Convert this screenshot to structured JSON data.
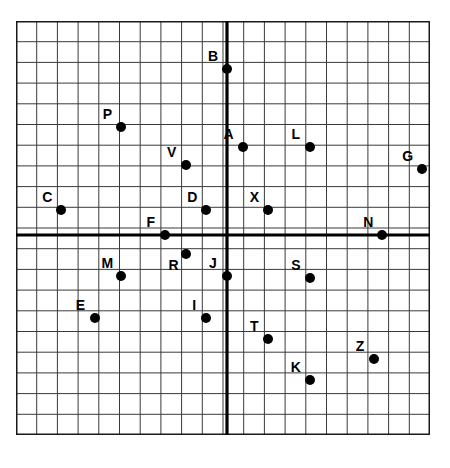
{
  "figure": {
    "type": "coordinate-plane",
    "grid": {
      "visible": true,
      "cell_size_px": 20.7,
      "columns": 20,
      "rows": 20,
      "line_color": "#3a3a3a",
      "border_color": "#1a1a1a",
      "background": "#ffffff"
    },
    "axes": {
      "color": "#000000",
      "x_axis_label": "",
      "y_axis_label": "",
      "origin_label": "",
      "arrows": [
        "left",
        "right",
        "up",
        "down"
      ],
      "xlim": [
        -10.2,
        9.8
      ],
      "ylim": [
        -10.3,
        9.7
      ],
      "tick_labels_visible": false
    }
  },
  "chart_data": {
    "type": "scatter",
    "title": "",
    "xlabel": "",
    "ylabel": "",
    "xlim": [
      -10.2,
      9.8
    ],
    "ylim": [
      -10.3,
      9.7
    ],
    "grid": true,
    "legend": "none",
    "point_color": "#000000",
    "labels": [
      "B",
      "P",
      "A",
      "L",
      "G",
      "V",
      "C",
      "D",
      "X",
      "F",
      "N",
      "R",
      "M",
      "J",
      "S",
      "E",
      "I",
      "T",
      "Z",
      "K"
    ],
    "points": [
      {
        "label": "B",
        "x": 0,
        "y": 8,
        "label_dx": -14,
        "label_dy": -13
      },
      {
        "label": "P",
        "x": -5.1,
        "y": 5.2,
        "label_dx": -14,
        "label_dy": -13
      },
      {
        "label": "A",
        "x": 0.75,
        "y": 4.25,
        "label_dx": -14,
        "label_dy": -13
      },
      {
        "label": "L",
        "x": 4,
        "y": 4.25,
        "label_dx": -14,
        "label_dy": -13
      },
      {
        "label": "G",
        "x": 9.4,
        "y": 3.2,
        "label_dx": -14,
        "label_dy": -13
      },
      {
        "label": "V",
        "x": -2,
        "y": 3.4,
        "label_dx": -14,
        "label_dy": -13
      },
      {
        "label": "C",
        "x": -8,
        "y": 1.2,
        "label_dx": -14,
        "label_dy": -13
      },
      {
        "label": "D",
        "x": -1,
        "y": 1.2,
        "label_dx": -14,
        "label_dy": -13
      },
      {
        "label": "X",
        "x": 2,
        "y": 1.2,
        "label_dx": -14,
        "label_dy": -13
      },
      {
        "label": "F",
        "x": -3,
        "y": 0,
        "label_dx": -14,
        "label_dy": -13
      },
      {
        "label": "N",
        "x": 7.5,
        "y": 0,
        "label_dx": -14,
        "label_dy": -13
      },
      {
        "label": "R",
        "x": -2,
        "y": -0.9,
        "label_dx": -12,
        "label_dy": 11
      },
      {
        "label": "M",
        "x": -5.1,
        "y": -2,
        "label_dx": -14,
        "label_dy": -13
      },
      {
        "label": "J",
        "x": 0,
        "y": -2,
        "label_dx": -14,
        "label_dy": -13
      },
      {
        "label": "S",
        "x": 4,
        "y": -2.1,
        "label_dx": -14,
        "label_dy": -13
      },
      {
        "label": "E",
        "x": -6.4,
        "y": -4,
        "label_dx": -14,
        "label_dy": -13
      },
      {
        "label": "I",
        "x": -1,
        "y": -4,
        "label_dx": -12,
        "label_dy": -13
      },
      {
        "label": "T",
        "x": 2,
        "y": -5,
        "label_dx": -14,
        "label_dy": -13
      },
      {
        "label": "Z",
        "x": 7.1,
        "y": -6,
        "label_dx": -14,
        "label_dy": -13
      },
      {
        "label": "K",
        "x": 4,
        "y": -7,
        "label_dx": -14,
        "label_dy": -13
      }
    ]
  }
}
